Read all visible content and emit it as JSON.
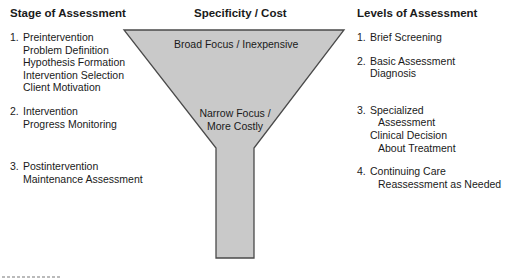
{
  "left": {
    "heading": "Stage of Assessment",
    "items": [
      {
        "num": "1.",
        "lines": [
          "Preintervention",
          "Problem Definition",
          "Hypothesis Formation",
          "Intervention Selection",
          "Client Motivation"
        ]
      },
      {
        "num": "2.",
        "lines": [
          "Intervention",
          "Progress Monitoring"
        ]
      },
      {
        "num": "3.",
        "lines": [
          "Postintervention",
          "Maintenance Assessment"
        ]
      }
    ]
  },
  "center": {
    "heading": "Specificity / Cost",
    "top_label": "Broad Focus / Inexpensive",
    "bottom_label_line1": "Narrow Focus /",
    "bottom_label_line2": "More Costly",
    "colors": {
      "fill": "#c9c9c9",
      "stroke": "#4a4a4a"
    }
  },
  "right": {
    "heading": "Levels of Assessment",
    "items": [
      {
        "num": "1.",
        "lines": [
          "Brief Screening"
        ]
      },
      {
        "num": "2.",
        "lines": [
          "Basic Assessment",
          "Diagnosis"
        ]
      },
      {
        "num": "3.",
        "lines": [
          "Specialized",
          "Assessment",
          "Clinical Decision",
          "About Treatment"
        ]
      },
      {
        "num": "4.",
        "lines": [
          "Continuing Care",
          "Reassessment as Needed"
        ]
      }
    ]
  }
}
